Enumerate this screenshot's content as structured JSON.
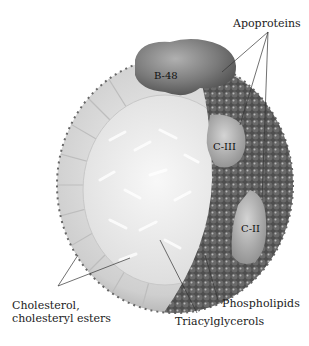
{
  "diagram": {
    "labels": {
      "apoproteins": "Apoproteins",
      "b48": "B-48",
      "c3": "C-III",
      "c2": "C-II",
      "cholesterol_line1": "Cholesterol,",
      "cholesterol_line2": "cholesteryl esters",
      "phospholipids": "Phospholipids",
      "triacylglycerols": "Triacylglycerols"
    },
    "colors": {
      "background": "#ffffff",
      "shell_light": "#d8d8d8",
      "core": "#ececec",
      "protein": "#7a7a7a",
      "phospholipid_dark": "#555555",
      "leader_line": "#333333"
    }
  }
}
